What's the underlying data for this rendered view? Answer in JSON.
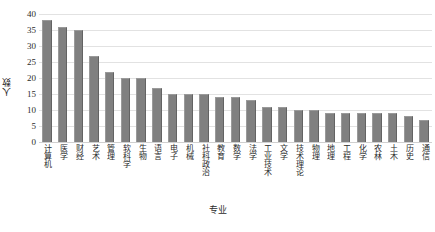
{
  "chart_data": {
    "type": "bar",
    "title": "",
    "xlabel": "专业",
    "ylabel": "人数",
    "ylim": [
      0,
      40
    ],
    "yticks": [
      0,
      5,
      10,
      15,
      20,
      25,
      30,
      35,
      40
    ],
    "grid": true,
    "legend": null,
    "bar_color": "#808080",
    "categories": [
      "计算机",
      "医学",
      "财经",
      "艺术",
      "管理",
      "软科学",
      "生物",
      "语言",
      "电子",
      "机械",
      "社科政治",
      "教育",
      "数学",
      "法学",
      "工业技术",
      "文学",
      "技术理论",
      "物理",
      "地理",
      "工程",
      "化学",
      "农林",
      "土木",
      "历史",
      "通信"
    ],
    "values": [
      38,
      36,
      35,
      27,
      22,
      20,
      20,
      17,
      15,
      15,
      15,
      14,
      14,
      13,
      11,
      11,
      10,
      10,
      9,
      9,
      9,
      9,
      9,
      8,
      7
    ]
  }
}
